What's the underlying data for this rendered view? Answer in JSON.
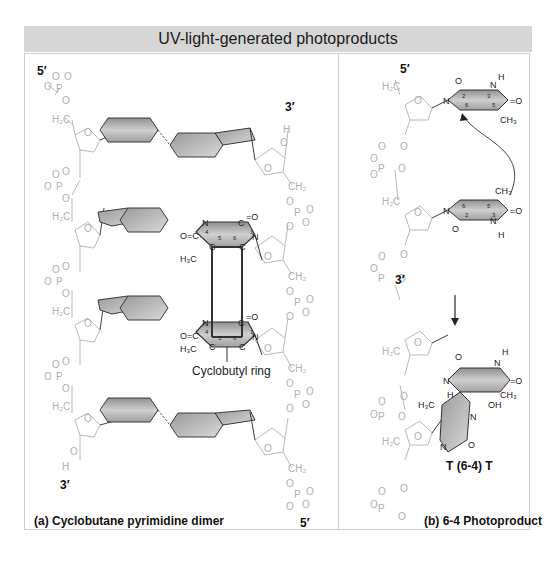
{
  "title": "UV-light-generated photoproducts",
  "panel_a": {
    "caption": "(a)  Cyclobutane pyrimidine dimer",
    "left_strand_top": "5′",
    "left_strand_bottom": "3′",
    "right_strand_top": "3′",
    "right_strand_bottom": "5′",
    "annotation": "Cyclobutyl ring",
    "atoms": {
      "n": "N",
      "c": "C",
      "o_dbl": "O=",
      "h3c": "H3C",
      "ring_numbers": [
        "4",
        "5",
        "6",
        "1",
        "2",
        "3"
      ]
    }
  },
  "panel_b": {
    "caption": "(b)  6-4 Photoproduct",
    "strand_top": "5′",
    "strand_bottom": "3′",
    "product_label": "T (6-4) T",
    "atoms": {
      "ch3": "CH3",
      "oh": "OH",
      "h": "H",
      "n": "N",
      "o": "O",
      "h3c": "H3C"
    }
  },
  "colors": {
    "title_bar": "#d6d6d6",
    "frame_border": "#d0d0d0",
    "backbone": "#b8b8b8",
    "base_fill": "#b5b5b5",
    "base_stroke": "#3a3a3a",
    "text": "#111111"
  }
}
